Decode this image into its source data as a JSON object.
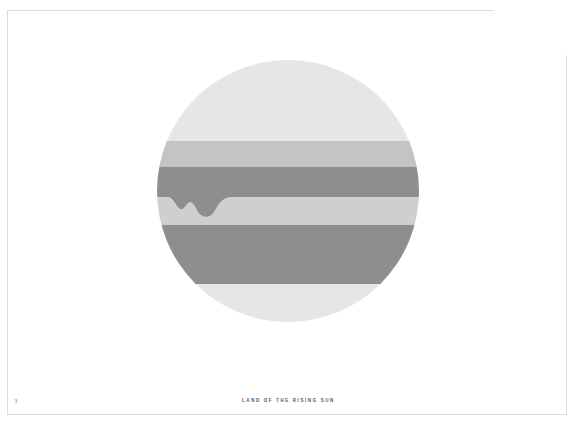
{
  "page": {
    "number": "3",
    "caption": "LAND OF THE RISING SUN"
  },
  "illustration": {
    "shape": "circle",
    "center": [
      288,
      191
    ],
    "radius": 131,
    "bands": [
      {
        "name": "top-pale",
        "y_from": 60,
        "y_to": 141,
        "color": "#e6e6e6"
      },
      {
        "name": "upper-mid",
        "y_from": 141,
        "y_to": 167,
        "color": "#c4c4c4"
      },
      {
        "name": "upper-dark",
        "y_from": 167,
        "y_to": 197,
        "color": "#8e8e8e"
      },
      {
        "name": "middle-light",
        "y_from": 197,
        "y_to": 225,
        "color": "#cfcfcf"
      },
      {
        "name": "lower-dark",
        "y_from": 225,
        "y_to": 284,
        "color": "#8e8e8e"
      },
      {
        "name": "bottom-pale",
        "y_from": 284,
        "y_to": 322,
        "color": "#e6e6e6"
      }
    ],
    "drip_color": "#8e8e8e"
  },
  "colors": {
    "frame": "#dcdcdc",
    "background": "#ffffff",
    "caption_text": "#555555",
    "page_number_text": "#8a8a8a"
  }
}
